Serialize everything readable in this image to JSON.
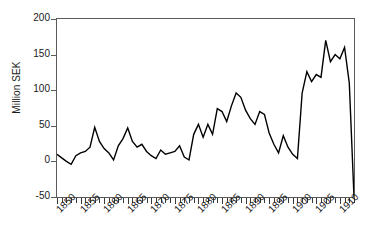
{
  "chart_data": {
    "type": "line",
    "title": "",
    "xlabel": "",
    "ylabel": "Million SEK",
    "xlim": [
      1850,
      1913
    ],
    "ylim": [
      -50,
      200
    ],
    "yticks": [
      200,
      150,
      100,
      50,
      0,
      -50
    ],
    "xticks": [
      1850,
      1855,
      1860,
      1865,
      1870,
      1875,
      1880,
      1885,
      1890,
      1895,
      1900,
      1905,
      1910
    ],
    "grid": false,
    "legend": false,
    "line_color": "#000000",
    "frame_color": "#5a5a5a",
    "x": [
      1850,
      1851,
      1852,
      1853,
      1854,
      1855,
      1856,
      1857,
      1858,
      1859,
      1860,
      1861,
      1862,
      1863,
      1864,
      1865,
      1866,
      1867,
      1868,
      1869,
      1870,
      1871,
      1872,
      1873,
      1874,
      1875,
      1876,
      1877,
      1878,
      1879,
      1880,
      1881,
      1882,
      1883,
      1884,
      1885,
      1886,
      1887,
      1888,
      1889,
      1890,
      1891,
      1892,
      1893,
      1894,
      1895,
      1896,
      1897,
      1898,
      1899,
      1900,
      1901,
      1902,
      1903,
      1904,
      1905,
      1906,
      1907,
      1908,
      1909,
      1910,
      1911,
      1912,
      1913
    ],
    "values": [
      10,
      5,
      0,
      -4,
      8,
      12,
      14,
      20,
      48,
      28,
      18,
      12,
      2,
      22,
      32,
      47,
      28,
      20,
      24,
      14,
      8,
      4,
      16,
      10,
      12,
      14,
      22,
      6,
      2,
      38,
      52,
      34,
      52,
      38,
      74,
      70,
      56,
      78,
      96,
      90,
      72,
      60,
      52,
      70,
      66,
      40,
      24,
      12,
      36,
      20,
      10,
      4,
      96,
      126,
      112,
      122,
      118,
      170,
      140,
      150,
      144,
      160,
      110,
      -50
    ],
    "series": [
      {
        "name": "Million SEK",
        "values": [
          10,
          5,
          0,
          -4,
          8,
          12,
          14,
          20,
          48,
          28,
          18,
          12,
          2,
          22,
          32,
          47,
          28,
          20,
          24,
          14,
          8,
          4,
          16,
          10,
          12,
          14,
          22,
          6,
          2,
          38,
          52,
          34,
          52,
          38,
          74,
          70,
          56,
          78,
          96,
          90,
          72,
          60,
          52,
          70,
          66,
          40,
          24,
          12,
          36,
          20,
          10,
          4,
          96,
          126,
          112,
          122,
          118,
          170,
          140,
          150,
          144,
          160,
          110,
          -50
        ]
      }
    ]
  },
  "axis": {
    "y_title": "Million SEK",
    "y_tick_labels": [
      "200",
      "150",
      "100",
      "50",
      "0",
      "-50"
    ],
    "x_tick_labels": [
      "1850",
      "1855",
      "1860",
      "1865",
      "1870",
      "1875",
      "1880",
      "1885",
      "1890",
      "1895",
      "1900",
      "1905",
      "1910"
    ]
  }
}
